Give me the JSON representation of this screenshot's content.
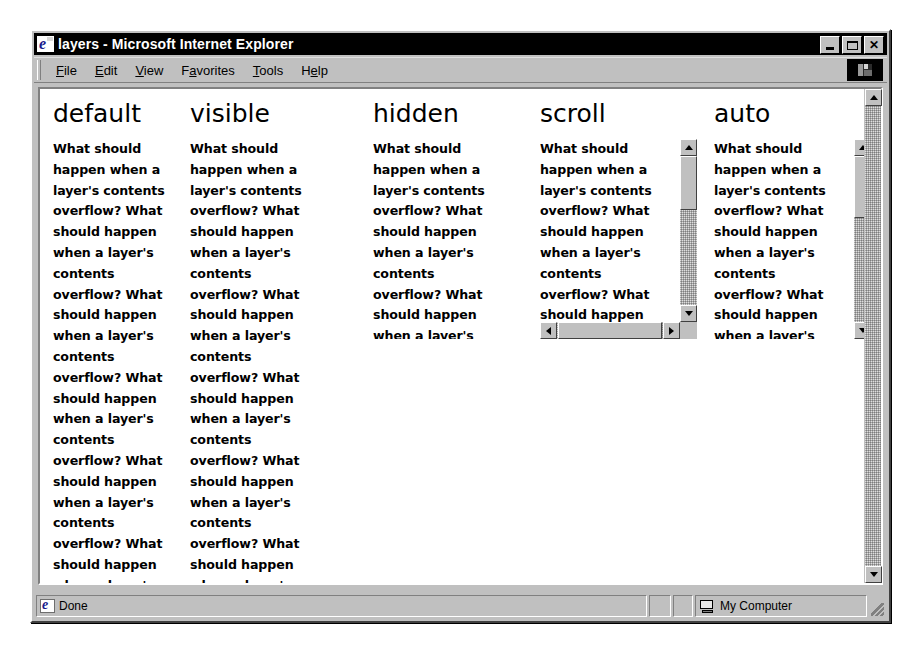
{
  "window": {
    "title": "layers - Microsoft Internet Explorer",
    "title_icon": "ie-document-icon",
    "controls": {
      "minimize": "minimize-icon",
      "maximize": "maximize-icon",
      "close": "close-icon"
    }
  },
  "menu": {
    "items": [
      {
        "label": "File",
        "mnemonic": "F"
      },
      {
        "label": "Edit",
        "mnemonic": "E"
      },
      {
        "label": "View",
        "mnemonic": "V"
      },
      {
        "label": "Favorites",
        "mnemonic": "a"
      },
      {
        "label": "Tools",
        "mnemonic": "T"
      },
      {
        "label": "Help",
        "mnemonic": "H"
      }
    ],
    "logo_button": "ie-logo-icon"
  },
  "page": {
    "sentence": "What should happen when a layer's contents overflow?",
    "columns": [
      {
        "heading": "default",
        "overflow_value": "default",
        "text": "What should happen when a layer's contents overflow? What should happen when a layer's contents overflow? What should happen when a layer's contents overflow? What should happen when a layer's contents overflow? What should happen when a layer's contents overflow? What should happen when a layer's contents overflow? What should happen when a layer's contents overflow?",
        "has_vertical_scrollbar": false,
        "has_horizontal_scrollbar": false,
        "clipped": false
      },
      {
        "heading": "visible",
        "overflow_value": "visible",
        "text": "What should happen when a layer's contents overflow? What should happen when a layer's contents overflow? What should happen when a layer's contents overflow? What should happen when a layer's contents overflow? What should happen when a layer's contents overflow? What should happen when a layer's contents overflow? What should happen when a layer's contents overflow?",
        "has_vertical_scrollbar": false,
        "has_horizontal_scrollbar": false,
        "clipped": false
      },
      {
        "heading": "hidden",
        "overflow_value": "hidden",
        "text": "What should happen when a layer's contents overflow? What should happen when a layer's contents overflow? What should happen when a layer's contents overflow? What should happen when a layer's contents overflow? What should happen when a layer's contents overflow? What should happen when a layer's contents overflow? What should happen when a layer's contents overflow?",
        "has_vertical_scrollbar": false,
        "has_horizontal_scrollbar": false,
        "clipped": true
      },
      {
        "heading": "scroll",
        "overflow_value": "scroll",
        "text": "What should happen when a layer's contents overflow? What should happen when a layer's contents overflow? What should happen when a layer's contents overflow? What should happen when a layer's contents overflow? What should happen when a layer's contents overflow? What should happen when a layer's contents overflow? What should happen when a layer's contents overflow?",
        "has_vertical_scrollbar": true,
        "has_horizontal_scrollbar": true,
        "clipped": true
      },
      {
        "heading": "auto",
        "overflow_value": "auto",
        "text": "What should happen when a layer's contents overflow? What should happen when a layer's contents overflow? What should happen when a layer's contents overflow? What should happen when a layer's contents overflow? What should happen when a layer's contents overflow? What should happen when a layer's contents overflow? What should happen when a layer's contents overflow?",
        "has_vertical_scrollbar": true,
        "has_horizontal_scrollbar": false,
        "clipped": true
      }
    ]
  },
  "status": {
    "message": "Done",
    "message_icon": "ie-document-icon",
    "zone_label": "My Computer",
    "zone_icon": "computer-icon"
  },
  "colors": {
    "chrome": "#c0c0c0",
    "titlebar": "#000000",
    "titlebar_text": "#ffffff",
    "page_background": "#ffffff",
    "text": "#000000"
  }
}
